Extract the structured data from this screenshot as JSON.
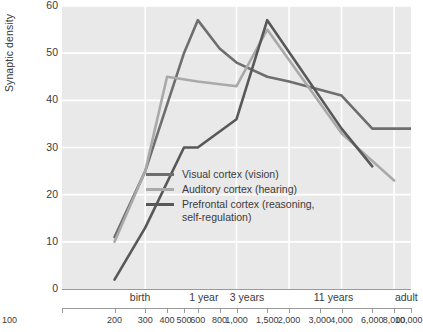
{
  "chart_data": {
    "type": "line",
    "title": "",
    "xlabel": "",
    "ylabel": "Synaptic density",
    "xscale": "log",
    "xlim": [
      100,
      10000
    ],
    "ylim": [
      0,
      60
    ],
    "grid": true,
    "legend_position": "inside-center-left",
    "y_ticks": [
      60,
      50,
      40,
      30,
      20,
      10,
      0
    ],
    "x_ticks": [
      100,
      200,
      300,
      400,
      500,
      600,
      800,
      1000,
      1500,
      2000,
      3000,
      4000,
      6000,
      8000,
      10000
    ],
    "x_tick_labels": [
      "100",
      "200",
      "300",
      "400",
      "500",
      "600",
      "800",
      "1,000",
      "1,500",
      "2,000",
      "3,000",
      "4,000",
      "6,000",
      "8,000",
      "10,000"
    ],
    "age_annotations": [
      {
        "label": "birth",
        "x": 280
      },
      {
        "label": "1 year",
        "x": 650
      },
      {
        "label": "3 years",
        "x": 1150
      },
      {
        "label": "11 years",
        "x": 3600
      },
      {
        "label": "adult",
        "x": 9400
      }
    ],
    "series": [
      {
        "name": "Visual cortex (vision)",
        "color": "#6e6e6e",
        "points": [
          {
            "x": 200,
            "y": 11
          },
          {
            "x": 300,
            "y": 25
          },
          {
            "x": 500,
            "y": 50
          },
          {
            "x": 600,
            "y": 57
          },
          {
            "x": 800,
            "y": 51
          },
          {
            "x": 1000,
            "y": 48
          },
          {
            "x": 1500,
            "y": 45
          },
          {
            "x": 2000,
            "y": 44
          },
          {
            "x": 4000,
            "y": 41
          },
          {
            "x": 6000,
            "y": 34
          },
          {
            "x": 10000,
            "y": 34
          }
        ]
      },
      {
        "name": "Auditory cortex (hearing)",
        "color": "#a9a9a9",
        "points": [
          {
            "x": 200,
            "y": 10
          },
          {
            "x": 300,
            "y": 25
          },
          {
            "x": 400,
            "y": 45
          },
          {
            "x": 600,
            "y": 44
          },
          {
            "x": 1000,
            "y": 43
          },
          {
            "x": 1500,
            "y": 55
          },
          {
            "x": 4000,
            "y": 33
          },
          {
            "x": 8000,
            "y": 23
          }
        ]
      },
      {
        "name": "Prefrontal cortex (reasoning,\nself-regulation)",
        "color": "#585858",
        "points": [
          {
            "x": 200,
            "y": 2
          },
          {
            "x": 300,
            "y": 13
          },
          {
            "x": 500,
            "y": 30
          },
          {
            "x": 600,
            "y": 30
          },
          {
            "x": 1000,
            "y": 36
          },
          {
            "x": 1500,
            "y": 57
          },
          {
            "x": 4000,
            "y": 34
          },
          {
            "x": 6000,
            "y": 26
          }
        ]
      }
    ]
  },
  "legend": {
    "items": [
      {
        "label": "Visual cortex (vision)",
        "color": "#6e6e6e"
      },
      {
        "label": "Auditory cortex (hearing)",
        "color": "#a9a9a9"
      },
      {
        "label": "Prefrontal cortex (reasoning,\nself-regulation)",
        "color": "#585858"
      }
    ]
  }
}
